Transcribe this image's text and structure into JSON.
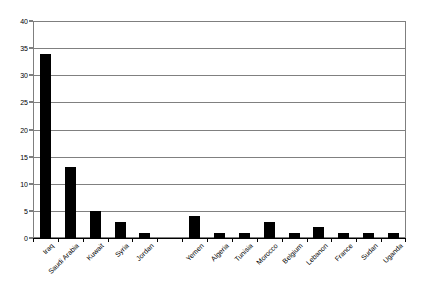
{
  "chart_data": {
    "type": "bar",
    "title": "",
    "subtitle": "",
    "xlabel": "",
    "ylabel": "",
    "ylim": [
      0,
      40
    ],
    "ytick_step": 5,
    "yticks": [
      "0",
      "5",
      "10",
      "15",
      "20",
      "25",
      "30",
      "35",
      "40"
    ],
    "grid": true,
    "legend": false,
    "legend_position": "none",
    "bar_color": "#000000",
    "gridline_color": "#808080",
    "plot_border_color": "#7f7f7f",
    "axis_color": "#000000",
    "background_color": "#ffffff",
    "categories": [
      "Iraq",
      "Saudi Arabia",
      "Kuwait",
      "Syria",
      "Jordan",
      "",
      "Yemen",
      "Algeria",
      "Tunisia",
      "Morocco",
      "Belgium",
      "Lebanon",
      "France",
      "Sudan",
      "Uganda"
    ],
    "values": [
      34,
      13,
      5,
      3,
      1,
      0,
      4,
      1,
      1,
      3,
      1,
      2,
      1,
      1,
      1
    ]
  }
}
